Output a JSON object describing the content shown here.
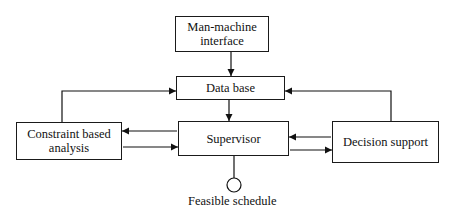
{
  "diagram": {
    "nodes": {
      "man_machine": {
        "label_line1": "Man-machine",
        "label_line2": "interface"
      },
      "database": {
        "label": "Data base"
      },
      "supervisor": {
        "label": "Supervisor"
      },
      "constraint": {
        "label_line1": "Constraint based",
        "label_line2": "analysis"
      },
      "decision": {
        "label": "Decision support"
      }
    },
    "output": {
      "label": "Feasible schedule"
    },
    "edges": [
      {
        "from": "Man-machine interface",
        "to": "Data base"
      },
      {
        "from": "Data base",
        "to": "Supervisor"
      },
      {
        "from": "Constraint based analysis",
        "to": "Data base"
      },
      {
        "from": "Decision support",
        "to": "Data base"
      },
      {
        "from": "Supervisor",
        "to": "Constraint based analysis"
      },
      {
        "from": "Constraint based analysis",
        "to": "Supervisor"
      },
      {
        "from": "Decision support",
        "to": "Supervisor"
      },
      {
        "from": "Supervisor",
        "to": "Decision support"
      },
      {
        "from": "Supervisor",
        "to": "Feasible schedule"
      }
    ]
  }
}
